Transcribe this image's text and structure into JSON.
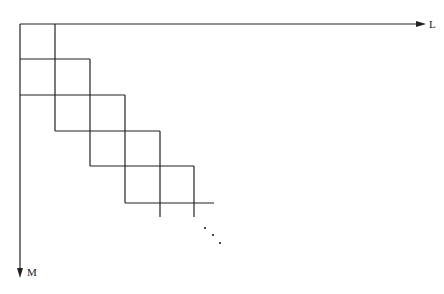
{
  "diagram": {
    "type": "staircase-grid",
    "axes": {
      "horizontal": {
        "label": "L",
        "from": [
          20,
          24
        ],
        "to": [
          426,
          24
        ]
      },
      "vertical": {
        "label": "M",
        "from": [
          20,
          24
        ],
        "to": [
          20,
          278
        ]
      }
    },
    "line_color": "#222222",
    "lines": [
      {
        "x1": 55,
        "y1": 24,
        "x2": 55,
        "y2": 131
      },
      {
        "x1": 90,
        "y1": 59,
        "x2": 90,
        "y2": 166
      },
      {
        "x1": 125,
        "y1": 95,
        "x2": 125,
        "y2": 203
      },
      {
        "x1": 160,
        "y1": 131,
        "x2": 160,
        "y2": 217
      },
      {
        "x1": 194,
        "y1": 166,
        "x2": 194,
        "y2": 217
      },
      {
        "x1": 20,
        "y1": 59,
        "x2": 90,
        "y2": 59
      },
      {
        "x1": 20,
        "y1": 95,
        "x2": 125,
        "y2": 95
      },
      {
        "x1": 55,
        "y1": 131,
        "x2": 160,
        "y2": 131
      },
      {
        "x1": 90,
        "y1": 166,
        "x2": 194,
        "y2": 166
      },
      {
        "x1": 125,
        "y1": 203,
        "x2": 214,
        "y2": 203
      }
    ],
    "ellipsis_dots": [
      [
        205,
        228
      ],
      [
        213,
        235
      ],
      [
        220,
        243
      ]
    ],
    "ellipsis_text": "..."
  }
}
